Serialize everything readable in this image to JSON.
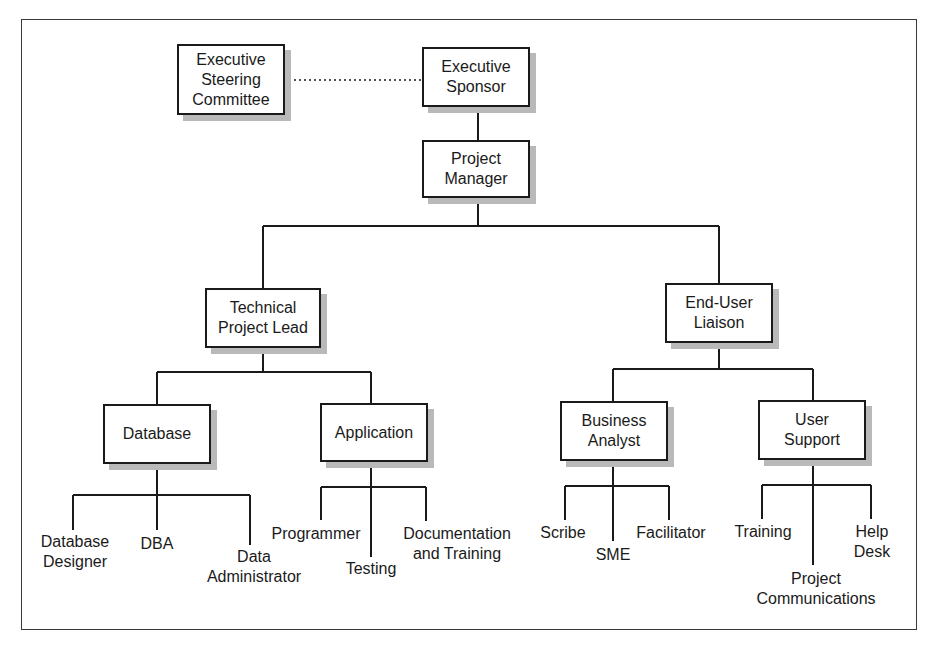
{
  "diagram": {
    "type": "org-chart",
    "nodes": {
      "steering": "Executive\nSteering\nCommittee",
      "sponsor": "Executive\nSponsor",
      "pm": "Project\nManager",
      "tech_lead": "Technical\nProject Lead",
      "liaison": "End-User\nLiaison",
      "database": "Database",
      "application": "Application",
      "analyst": "Business\nAnalyst",
      "support": "User\nSupport"
    },
    "leaves": {
      "db_designer": "Database\nDesigner",
      "dba": "DBA",
      "data_admin": "Data\nAdministrator",
      "programmer": "Programmer",
      "testing": "Testing",
      "doc_training": "Documentation\nand Training",
      "scribe": "Scribe",
      "sme": "SME",
      "facilitator": "Facilitator",
      "training": "Training",
      "project_comms": "Project\nCommunications",
      "help_desk": "Help\nDesk"
    },
    "edges": [
      {
        "from": "Executive Steering Committee",
        "to": "Executive Sponsor",
        "style": "dotted"
      },
      {
        "from": "Executive Sponsor",
        "to": "Project Manager"
      },
      {
        "from": "Project Manager",
        "to": "Technical Project Lead"
      },
      {
        "from": "Project Manager",
        "to": "End-User Liaison"
      },
      {
        "from": "Technical Project Lead",
        "to": "Database"
      },
      {
        "from": "Technical Project Lead",
        "to": "Application"
      },
      {
        "from": "End-User Liaison",
        "to": "Business Analyst"
      },
      {
        "from": "End-User Liaison",
        "to": "User Support"
      },
      {
        "from": "Database",
        "to": "Database Designer"
      },
      {
        "from": "Database",
        "to": "DBA"
      },
      {
        "from": "Database",
        "to": "Data Administrator"
      },
      {
        "from": "Application",
        "to": "Programmer"
      },
      {
        "from": "Application",
        "to": "Testing"
      },
      {
        "from": "Application",
        "to": "Documentation and Training"
      },
      {
        "from": "Business Analyst",
        "to": "Scribe"
      },
      {
        "from": "Business Analyst",
        "to": "SME"
      },
      {
        "from": "Business Analyst",
        "to": "Facilitator"
      },
      {
        "from": "User Support",
        "to": "Training"
      },
      {
        "from": "User Support",
        "to": "Project Communications"
      },
      {
        "from": "User Support",
        "to": "Help Desk"
      }
    ],
    "colors": {
      "line": "#1a1a1a",
      "shadow": "#b9b9b9",
      "frame": "#3a3a3a"
    }
  }
}
